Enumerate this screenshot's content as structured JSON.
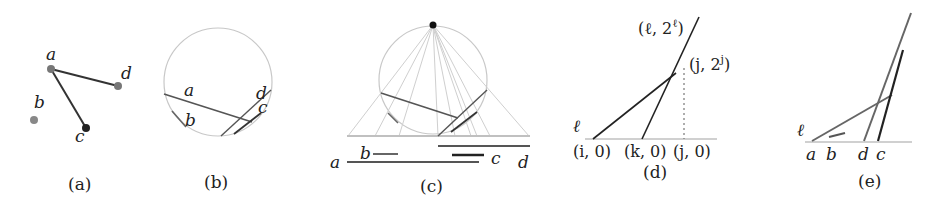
{
  "figure": {
    "panels": [
      {
        "id": "a",
        "caption": "(a)",
        "points": [
          {
            "name": "a",
            "label": "a"
          },
          {
            "name": "b",
            "label": "b"
          },
          {
            "name": "c",
            "label": "c"
          },
          {
            "name": "d",
            "label": "d"
          }
        ],
        "edges": [
          "a-d",
          "a-c"
        ]
      },
      {
        "id": "b",
        "caption": "(b)",
        "segment_labels": [
          "a",
          "b",
          "c",
          "d"
        ]
      },
      {
        "id": "c",
        "caption": "(c)",
        "interval_labels": [
          "a",
          "b",
          "c",
          "d"
        ]
      },
      {
        "id": "d",
        "caption": "(d)",
        "line_label": "ℓ",
        "top_label": "(ℓ, 2ℓ)",
        "top_label_base": "(ℓ, 2",
        "top_label_sup": "ℓ",
        "top_label_end": ")",
        "mid_label_base": "(j, 2",
        "mid_label_sup": "j",
        "mid_label_end": ")",
        "axis_labels": [
          "(i, 0)",
          "(k, 0)",
          "(j, 0)"
        ]
      },
      {
        "id": "e",
        "caption": "(e)",
        "line_label": "ℓ",
        "axis_labels": [
          "a",
          "b",
          "d",
          "c"
        ]
      }
    ],
    "colors": {
      "dark_line": "#2a2a2a",
      "mid_line": "#555555",
      "gray_line": "#6a6a6a",
      "light_line": "#bdbdbd",
      "circle": "#c8c8c8",
      "baseline": "#c0c0c0"
    }
  }
}
